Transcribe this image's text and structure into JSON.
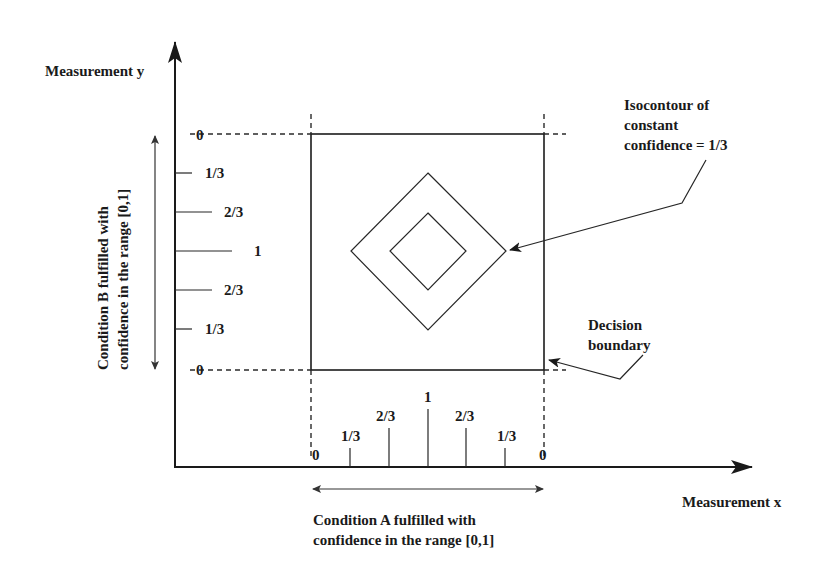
{
  "axes": {
    "y_label": "Measurement y",
    "x_label": "Measurement x"
  },
  "ranges": {
    "condition_b": {
      "line1": "Condition B fulfilled with",
      "line2": "confidence in the range [0,1]"
    },
    "condition_a": {
      "line1": "Condition A fulfilled with",
      "line2": "confidence in the range [0,1]"
    }
  },
  "y_ticks": [
    {
      "label": "0"
    },
    {
      "label": "1/3"
    },
    {
      "label": "2/3"
    },
    {
      "label": "1"
    },
    {
      "label": "2/3"
    },
    {
      "label": "1/3"
    },
    {
      "label": "0"
    }
  ],
  "x_ticks": [
    {
      "label": "0"
    },
    {
      "label": "1/3"
    },
    {
      "label": "2/3"
    },
    {
      "label": "1"
    },
    {
      "label": "2/3"
    },
    {
      "label": "1/3"
    },
    {
      "label": "0"
    }
  ],
  "annotations": {
    "isocontour": {
      "line1": "Isocontour of",
      "line2": "constant",
      "line3": "confidence = 1/3"
    },
    "decision_boundary": {
      "line1": "Decision",
      "line2": "boundary"
    }
  },
  "colors": {
    "ink": "#1a1a1a",
    "background": "#ffffff"
  }
}
